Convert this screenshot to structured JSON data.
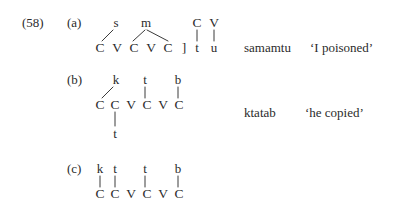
{
  "figure": {
    "example_number": "(58)",
    "background_color": "#ffffff",
    "text_color": "#2b2b2b",
    "line_color": "#3a3a3a"
  },
  "rows": {
    "a": {
      "label": "(a)",
      "melody": [
        "s",
        "m"
      ],
      "skeleton": [
        "C",
        "V",
        "C",
        "V",
        "C"
      ],
      "bracket": "]",
      "suffix_skeleton": [
        "C",
        "V"
      ],
      "suffix_melody": [
        "t",
        "u"
      ],
      "word": "samamtu",
      "gloss": "‘I poisoned’"
    },
    "b": {
      "label": "(b)",
      "melody": [
        "k",
        "t",
        "b"
      ],
      "skeleton": [
        "C",
        "C",
        "V",
        "C",
        "V",
        "C"
      ],
      "lower_melody": "t",
      "word": "ktatab",
      "gloss": "‘he copied’"
    },
    "c": {
      "label": "(c)",
      "melody": [
        "k",
        "t",
        "t",
        "b"
      ],
      "skeleton": [
        "C",
        "C",
        "V",
        "C",
        "V",
        "C"
      ],
      "word": "",
      "gloss": ""
    }
  }
}
